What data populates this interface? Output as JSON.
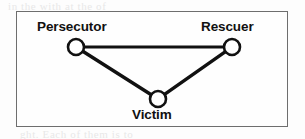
{
  "figure": {
    "kind": "drama-triangle-diagram",
    "border_color": "#6e6e6e",
    "background_color": "#fefefe",
    "stroke_color": "#111111"
  },
  "nodes": [
    {
      "id": "persecutor",
      "label": "Persecutor",
      "cx": 76,
      "cy": 47,
      "r": 8
    },
    {
      "id": "rescuer",
      "label": "Rescuer",
      "cx": 232,
      "cy": 47,
      "r": 8
    },
    {
      "id": "victim",
      "label": "Victim",
      "cx": 158,
      "cy": 99,
      "r": 8
    }
  ],
  "edges": [
    {
      "id": "persecutor-rescuer",
      "from": "persecutor",
      "to": "rescuer"
    },
    {
      "id": "persecutor-victim",
      "from": "persecutor",
      "to": "victim"
    },
    {
      "id": "rescuer-victim",
      "from": "rescuer",
      "to": "victim"
    }
  ],
  "ghost_text": {
    "top": "in the with at the of",
    "mid_left": "an will as it",
    "mid_right": "a to the people are",
    "bottom": "ght. Each of them is to"
  }
}
